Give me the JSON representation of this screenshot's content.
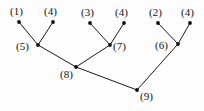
{
  "diagram": {
    "type": "tree-graph",
    "title": "",
    "background_color": "#fdfdfd",
    "node_color": "#101010",
    "edge_color": "#1a1a1a",
    "label_color": "#141414"
  },
  "nodes": [
    {
      "id": "n1",
      "label": "(1)",
      "x": 19,
      "y": 22,
      "label_x": 10,
      "label_y": 6,
      "level": "leaf"
    },
    {
      "id": "n4a",
      "label": "(4)",
      "x": 53,
      "y": 22,
      "label_x": 44,
      "label_y": 6,
      "level": "leaf"
    },
    {
      "id": "n3",
      "label": "(3)",
      "x": 90,
      "y": 23,
      "label_x": 81,
      "label_y": 7,
      "level": "leaf"
    },
    {
      "id": "n4b",
      "label": "(4)",
      "x": 124,
      "y": 23,
      "label_x": 115,
      "label_y": 7,
      "level": "leaf"
    },
    {
      "id": "n2",
      "label": "(2)",
      "x": 158,
      "y": 23,
      "label_x": 149,
      "label_y": 7,
      "level": "leaf"
    },
    {
      "id": "n4c",
      "label": "(4)",
      "x": 190,
      "y": 23,
      "label_x": 181,
      "label_y": 7,
      "level": "leaf"
    },
    {
      "id": "n5",
      "label": "(5)",
      "x": 38,
      "y": 45,
      "label_x": 16,
      "label_y": 41,
      "level": "internal"
    },
    {
      "id": "n7",
      "label": "(7)",
      "x": 110,
      "y": 45,
      "label_x": 113,
      "label_y": 41,
      "level": "internal"
    },
    {
      "id": "n6",
      "label": "(6)",
      "x": 178,
      "y": 44,
      "label_x": 155,
      "label_y": 40,
      "level": "internal"
    },
    {
      "id": "n8",
      "label": "(8)",
      "x": 76,
      "y": 67,
      "label_x": 60,
      "label_y": 69,
      "level": "internal"
    },
    {
      "id": "n9",
      "label": "(9)",
      "x": 137,
      "y": 90,
      "label_x": 140,
      "label_y": 91,
      "level": "root"
    }
  ],
  "edges": [
    {
      "from": "n1",
      "to": "n5",
      "x1": 19,
      "y1": 22,
      "x2": 38,
      "y2": 45
    },
    {
      "from": "n4a",
      "to": "n5",
      "x1": 53,
      "y1": 22,
      "x2": 38,
      "y2": 45
    },
    {
      "from": "n3",
      "to": "n7",
      "x1": 90,
      "y1": 23,
      "x2": 110,
      "y2": 45
    },
    {
      "from": "n4b",
      "to": "n7",
      "x1": 124,
      "y1": 23,
      "x2": 110,
      "y2": 45
    },
    {
      "from": "n2",
      "to": "n6",
      "x1": 158,
      "y1": 23,
      "x2": 178,
      "y2": 44
    },
    {
      "from": "n4c",
      "to": "n6",
      "x1": 190,
      "y1": 23,
      "x2": 178,
      "y2": 44
    },
    {
      "from": "n5",
      "to": "n8",
      "x1": 38,
      "y1": 45,
      "x2": 76,
      "y2": 67
    },
    {
      "from": "n7",
      "to": "n8",
      "x1": 110,
      "y1": 45,
      "x2": 76,
      "y2": 67
    },
    {
      "from": "n8",
      "to": "n9",
      "x1": 76,
      "y1": 67,
      "x2": 137,
      "y2": 90
    },
    {
      "from": "n6",
      "to": "n9",
      "x1": 178,
      "y1": 44,
      "x2": 137,
      "y2": 90
    }
  ]
}
